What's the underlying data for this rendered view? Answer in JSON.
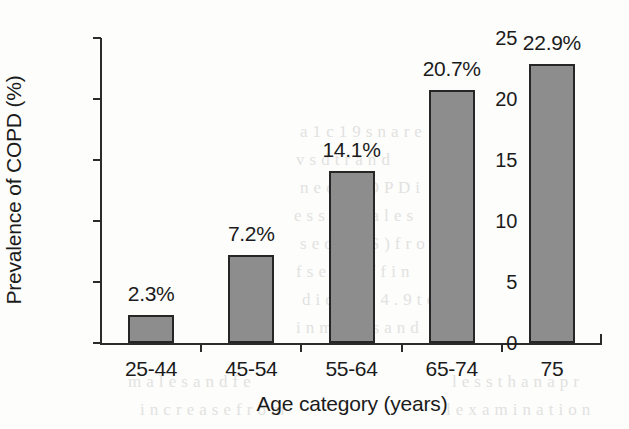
{
  "chart_data": {
    "type": "bar",
    "title": "",
    "subtitle": "",
    "xlabel": "Age category (years)",
    "ylabel": "Prevalence of COPD (%)",
    "categories": [
      "25-44",
      "45-54",
      "55-64",
      "65-74",
      "75"
    ],
    "values": [
      2.3,
      7.2,
      14.1,
      20.7,
      22.9
    ],
    "data_labels": [
      "2.3%",
      "7.2%",
      "14.1%",
      "20.7%",
      "22.9%"
    ],
    "ylim": [
      0,
      25
    ],
    "yticks": [
      0,
      5,
      10,
      15,
      20,
      25
    ],
    "ytick_labels": [
      "0",
      "5",
      "10",
      "15",
      "20",
      "25"
    ],
    "xlim_note": "categorical",
    "grid": false,
    "legend": false,
    "legend_position": "none",
    "series": [
      {
        "name": "Prevalence of COPD",
        "values": [
          2.3,
          7.2,
          14.1,
          20.7,
          22.9
        ]
      }
    ],
    "colors": {
      "bar_fill": "#8d8d8d",
      "bar_edge": "#262626",
      "axis": "#2b2b2b",
      "text": "#1b1b1b",
      "background": "#fdfdfc"
    }
  },
  "bleed_text": [
    "a 1 c 1 9 s n  a r e",
    "v  s  d  t  r  a n d",
    "n e  o f  C O P D  i",
    "e s s  i n  m a l e s",
    "s e d  C A S ) f r o m",
    "f  s e n  s n  f f  i n",
    "d i c  r o m  4 . 9  t o",
    "i n  m a l e s  a n d",
    "m a l e s  a n d  f e",
    "i n c r e a s e  f r o m",
    "l e s s  t h a n  a  p r",
    "l  e x a m i n a t i o n"
  ]
}
